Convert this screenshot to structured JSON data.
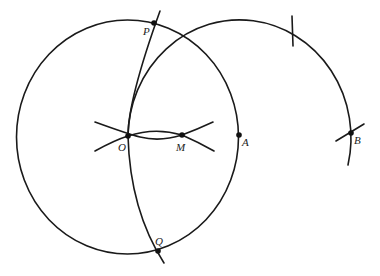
{
  "diagram": {
    "type": "geometric-construction",
    "points": {
      "O": {
        "label": "O",
        "x": 128,
        "y": 136
      },
      "M": {
        "label": "M",
        "x": 182,
        "y": 135
      },
      "A": {
        "label": "A",
        "x": 239,
        "y": 135
      },
      "B": {
        "label": "B",
        "x": 351,
        "y": 133
      },
      "P": {
        "label": "P",
        "x": 154,
        "y": 23
      },
      "Q": {
        "label": "Q",
        "x": 158,
        "y": 251
      }
    },
    "colors": {
      "stroke": "#1a1a1a",
      "background": "#ffffff"
    }
  }
}
